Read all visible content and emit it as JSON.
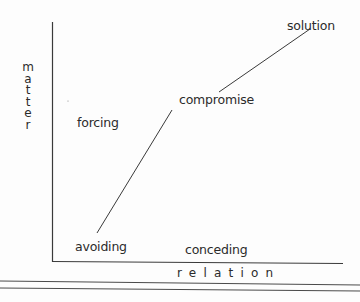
{
  "diagram": {
    "type": "two-axis conflict-resolution grid",
    "axes": {
      "x_label": "relation",
      "y_label": "matter",
      "y_label_letters": [
        "m",
        "a",
        "t",
        "t",
        "e",
        "r"
      ]
    },
    "points": {
      "solution": "solution",
      "compromise": "compromise",
      "forcing": "forcing",
      "avoiding": "avoiding",
      "conceding": "conceding"
    },
    "diagonal": {
      "from": "avoiding",
      "via": "compromise",
      "to": "solution"
    },
    "colors": {
      "line": "#3a3a3a",
      "text": "#2b2b2b",
      "background": "#fdfdfd"
    }
  }
}
